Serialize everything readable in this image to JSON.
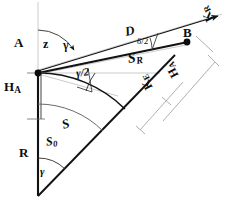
{
  "figure": {
    "type": "geometric-diagram",
    "background_color": "#ffffff",
    "line_color": "#121212",
    "thin_line_color": "#9a9a9a",
    "points": {
      "A": {
        "label": "A",
        "x": 38,
        "y": 73
      },
      "B": {
        "label": "B",
        "x": 186,
        "y": 42
      }
    },
    "labels": {
      "point_a": "A",
      "point_b": "B",
      "zenith_angle": "z",
      "gamma_top": "γ",
      "gamma_half": "γ/2",
      "gamma_bottom": "γ",
      "chord_d": "D",
      "delta_half": "δ/2",
      "arc_sr": "S",
      "arc_sr_sub": "R",
      "arc_s": "S",
      "arc_s0": "S",
      "arc_s0_sub": "0",
      "radius_r": "R",
      "height_a": "H",
      "height_a_sub": "A",
      "height_b": "H",
      "height_b_sub": "A",
      "curv_ke": "K",
      "curv_ke_sub": "E",
      "curv_kr": "K",
      "curv_kr_sub": "R"
    }
  }
}
